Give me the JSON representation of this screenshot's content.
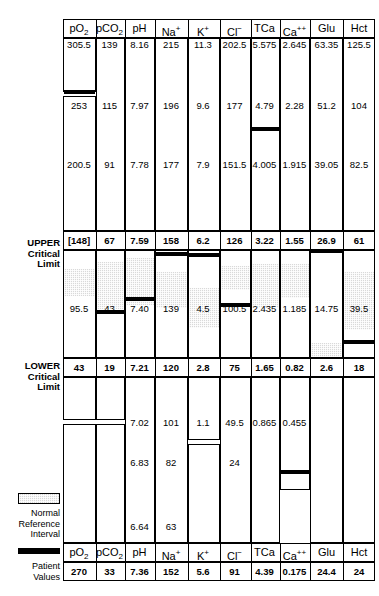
{
  "chart_data": {
    "type": "table",
    "legend": {
      "normal_reference_interval": "Normal\nReference\nInterval",
      "patient_values": "Patient\nValues"
    },
    "row_labels": {
      "upper_critical_limit": "UPPER\nCritical\nLimit",
      "lower_critical_limit": "LOWER\nCritical\nLimit"
    },
    "columns": [
      {
        "key": "pO2",
        "label": "pO",
        "sub": "2",
        "sup": "",
        "scale_ticks": [
          "305.5",
          "253",
          "200.5"
        ],
        "upper_critical": "[148]",
        "lower_critical": "43",
        "lower_ticks": [],
        "nri_label": "95.5",
        "patient_value": "270"
      },
      {
        "key": "pCO2",
        "label": "pCO",
        "sub": "2",
        "sup": "",
        "scale_ticks": [
          "139",
          "115",
          "91"
        ],
        "upper_critical": "67",
        "lower_critical": "19",
        "lower_ticks": [],
        "nri_label": "43",
        "patient_value": "33"
      },
      {
        "key": "pH",
        "label": "pH",
        "sub": "",
        "sup": "",
        "scale_ticks": [
          "8.16",
          "7.97",
          "7.78"
        ],
        "upper_critical": "7.59",
        "lower_critical": "7.21",
        "lower_ticks": [
          "7.02",
          "6.83",
          "6.64"
        ],
        "nri_label": "7.40",
        "patient_value": "7.36"
      },
      {
        "key": "Na",
        "label": "Na",
        "sub": "",
        "sup": "+",
        "scale_ticks": [
          "215",
          "196",
          "177"
        ],
        "upper_critical": "158",
        "lower_critical": "120",
        "lower_ticks": [
          "101",
          "82",
          "63"
        ],
        "nri_label": "139",
        "patient_value": "152"
      },
      {
        "key": "K",
        "label": "K",
        "sub": "",
        "sup": "+",
        "scale_ticks": [
          "11.3",
          "9.6",
          "7.9"
        ],
        "upper_critical": "6.2",
        "lower_critical": "2.8",
        "lower_ticks": [
          "1.1"
        ],
        "nri_label": "4.5",
        "patient_value": "5.6"
      },
      {
        "key": "Cl",
        "label": "Cl",
        "sub": "",
        "sup": "−",
        "scale_ticks": [
          "202.5",
          "177",
          "151.5"
        ],
        "upper_critical": "126",
        "lower_critical": "75",
        "lower_ticks": [
          "49.5",
          "24"
        ],
        "nri_label": "100.5",
        "patient_value": "91"
      },
      {
        "key": "TCa",
        "label": "TCa",
        "sub": "",
        "sup": "",
        "scale_ticks": [
          "5.575",
          "4.79",
          "4.005"
        ],
        "upper_critical": "3.22",
        "lower_critical": "1.65",
        "lower_ticks": [
          "0.865"
        ],
        "nri_label": "2.435",
        "patient_value": "4.39"
      },
      {
        "key": "Ca",
        "label": "Ca",
        "sub": "",
        "sup": "++",
        "scale_ticks": [
          "2.645",
          "2.28",
          "1.915"
        ],
        "upper_critical": "1.55",
        "lower_critical": "0.82",
        "lower_ticks": [
          "0.455"
        ],
        "nri_label": "1.185",
        "patient_value": "0.175"
      },
      {
        "key": "Glu",
        "label": "Glu",
        "sub": "",
        "sup": "",
        "scale_ticks": [
          "63.35",
          "51.2",
          "39.05"
        ],
        "upper_critical": "26.9",
        "lower_critical": "2.6",
        "lower_ticks": [],
        "nri_label": "14.75",
        "patient_value": "24.4"
      },
      {
        "key": "Hct",
        "label": "Hct",
        "sub": "",
        "sup": "",
        "scale_ticks": [
          "125.5",
          "104",
          "82.5"
        ],
        "upper_critical": "61",
        "lower_critical": "18",
        "lower_ticks": [],
        "nri_label": "39.5",
        "patient_value": "24"
      }
    ]
  }
}
